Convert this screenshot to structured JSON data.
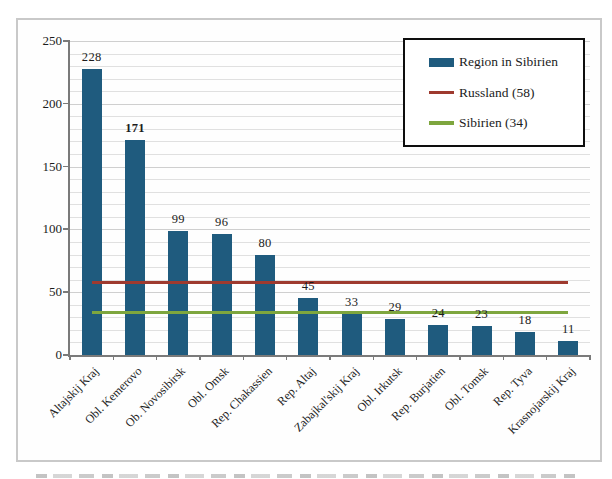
{
  "chart_data": {
    "type": "bar",
    "title": "",
    "xlabel": "",
    "ylabel": "",
    "categories": [
      "Altajskij Kraj",
      "Obl. Kemerovo",
      "Ob. Novosibirsk",
      "Obl. Omsk",
      "Rep. Chakassien",
      "Rep. Altaj",
      "Zabajkal'skij Kraj",
      "Obl. Irkutsk",
      "Rep. Burjatien",
      "Obl. Tomsk",
      "Rep. Tyva",
      "Krasnojarskij Kraj"
    ],
    "series": [
      {
        "name": "Region in Sibirien",
        "type": "bar",
        "color": "#1f5b7e",
        "values": [
          228,
          171,
          99,
          96,
          80,
          45,
          33,
          29,
          24,
          23,
          18,
          11
        ],
        "bold_value_index": 1
      },
      {
        "name": "Russland (58)",
        "type": "line",
        "color": "#9e3a2f",
        "value": 58
      },
      {
        "name": "Sibirien (34)",
        "type": "line",
        "color": "#7ea63e",
        "value": 34
      }
    ],
    "ylim": [
      0,
      250
    ],
    "y_major_ticks": [
      0,
      50,
      100,
      150,
      200,
      250
    ],
    "y_minor_step": 10,
    "grid": true,
    "legend_position": "top-right"
  },
  "colors": {
    "bar": "#1f5b7e",
    "russland_line": "#9e3a2f",
    "sibirien_line": "#7ea63e",
    "grid_minor": "#e0e0e0",
    "grid_major": "#cfcfcf",
    "axis": "#7a7a7a",
    "frame_border": "#c9c9c9",
    "legend_border": "#0e0e0e",
    "text": "#1c1c1c"
  }
}
